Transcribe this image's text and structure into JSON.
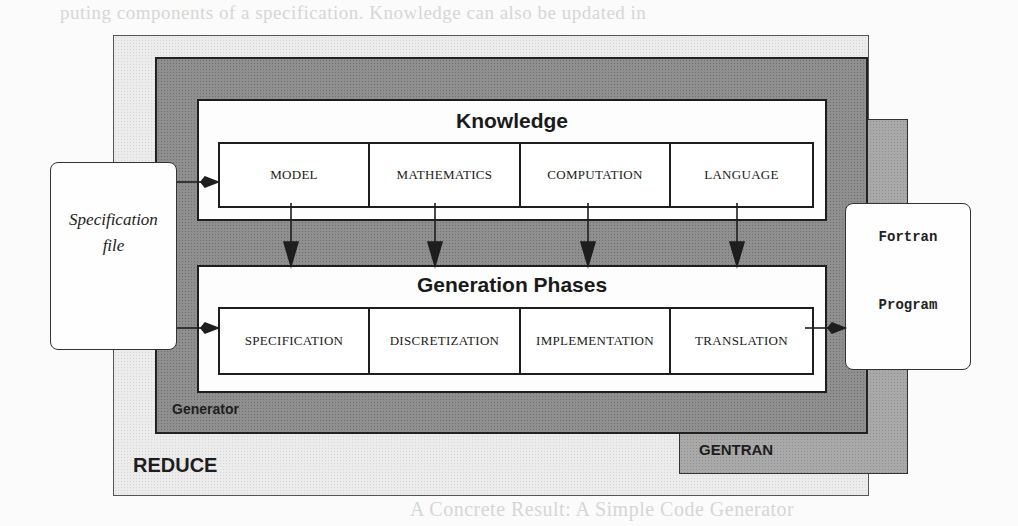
{
  "background_text": [
    "puting components of a specification. Knowledge can also be updated in",
    "ng new data. Knowledge on discretization, algorithms, code structures etc.",
    "ted by prescribing procedures from a library. An in- and output",
    "a high level of abstraction incorporating an explicit separation of tasks",
    "the application of rules, knowledge and data, on a high level of abstraction",
    "the tasks and knowledge of a compiler.",
    "A Concrete Result: A Simple Code Generator"
  ],
  "diagram": {
    "reduce": {
      "label": "REDUCE"
    },
    "generator": {
      "label": "Generator"
    },
    "gentran": {
      "label": "GENTRAN"
    },
    "knowledge": {
      "title": "Knowledge",
      "cells": [
        "MODEL",
        "MATHEMATICS",
        "COMPUTATION",
        "LANGUAGE"
      ]
    },
    "generation_phases": {
      "title": "Generation Phases",
      "cells": [
        "SPECIFICATION",
        "DISCRETIZATION",
        "IMPLEMENTATION",
        "TRANSLATION"
      ]
    },
    "input": {
      "line1": "Specification",
      "line2": "file"
    },
    "output": {
      "line1": "Fortran",
      "line2": "Program"
    },
    "colors": {
      "reduce_fill": "#ececec",
      "generator_fill": "#8f8f8f",
      "gentran_fill": "#a9a9a9",
      "panel_fill": "#fdfdfd",
      "stroke": "#1e1e1e"
    }
  }
}
